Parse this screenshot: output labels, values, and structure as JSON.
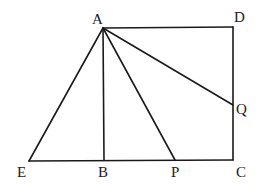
{
  "diagram": {
    "type": "geometry",
    "points": {
      "A": {
        "label": "A",
        "x": 103,
        "y": 28
      },
      "D": {
        "label": "D",
        "x": 233,
        "y": 27
      },
      "Q": {
        "label": "Q",
        "x": 233,
        "y": 105
      },
      "C": {
        "label": "C",
        "x": 233,
        "y": 160
      },
      "P": {
        "label": "P",
        "x": 175,
        "y": 160
      },
      "B": {
        "label": "B",
        "x": 104,
        "y": 160
      },
      "E": {
        "label": "E",
        "x": 29,
        "y": 161
      }
    },
    "segments": [
      "AD",
      "DC",
      "CE",
      "AE",
      "AB",
      "AP",
      "AQ"
    ],
    "colors": {
      "stroke": "#1a1a1a",
      "background": "#ffffff"
    }
  }
}
